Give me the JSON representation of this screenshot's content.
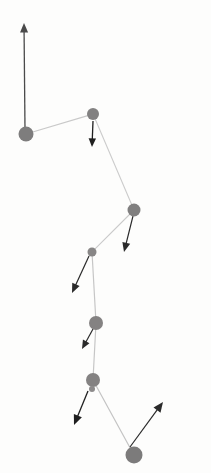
{
  "figure": {
    "title": "",
    "width": 211,
    "height": 473,
    "background_color": "#fdfdfc",
    "node_color": "#807f7f",
    "edge_color": "#c9c9c9",
    "arrow_color": "#1a1a1a"
  },
  "chart_data": {
    "type": "scatter",
    "title": "",
    "xlabel": "",
    "ylabel": "",
    "xlim": [
      0,
      211
    ],
    "ylim": [
      0,
      473
    ],
    "grid": false,
    "legend": null,
    "nodes": [
      {
        "id": "n1",
        "x": 26,
        "y": 134,
        "r": 7.5,
        "color": "#7e7d7d"
      },
      {
        "id": "n2",
        "x": 93,
        "y": 114,
        "r": 6.0,
        "color": "#828181"
      },
      {
        "id": "n3",
        "x": 134,
        "y": 210,
        "r": 6.5,
        "color": "#807f7f"
      },
      {
        "id": "n4",
        "x": 92,
        "y": 252,
        "r": 4.5,
        "color": "#888686"
      },
      {
        "id": "n5",
        "x": 96,
        "y": 323,
        "r": 7.0,
        "color": "#848282"
      },
      {
        "id": "n6",
        "x": 93,
        "y": 380,
        "r": 7.0,
        "color": "#848282"
      },
      {
        "id": "n7",
        "x": 92,
        "y": 389,
        "r": 3.0,
        "color": "#8d8b8b"
      },
      {
        "id": "n8",
        "x": 134,
        "y": 455,
        "r": 8.5,
        "color": "#7c7b7b"
      }
    ],
    "edges": [
      {
        "from": "n1",
        "to": "n2",
        "color": "#c9c9c9",
        "width": 1.2
      },
      {
        "from": "n2",
        "to": "n3",
        "color": "#cccccc",
        "width": 1.1
      },
      {
        "from": "n3",
        "to": "n4",
        "color": "#cacaca",
        "width": 1.1
      },
      {
        "from": "n4",
        "to": "n5",
        "color": "#c6c6c6",
        "width": 1.2
      },
      {
        "from": "n5",
        "to": "n6",
        "color": "#c6c6c6",
        "width": 1.2
      },
      {
        "from": "n6",
        "to": "n8",
        "color": "#c4c4c4",
        "width": 1.2
      }
    ],
    "arrows": [
      {
        "id": "a1",
        "from": "n1",
        "x1": 25,
        "y1": 130,
        "x2": 24,
        "y2": 23,
        "color": "#4a4a4a",
        "width": 1.3,
        "head": 6.5,
        "label": "up"
      },
      {
        "id": "a2",
        "from": "n2",
        "x1": 93,
        "y1": 121,
        "x2": 92,
        "y2": 147,
        "color": "#1f1f1f",
        "width": 1.3,
        "head": 6.0,
        "label": "down"
      },
      {
        "id": "a3",
        "from": "n3",
        "x1": 133,
        "y1": 216,
        "x2": 124,
        "y2": 252,
        "color": "#2a2a2a",
        "width": 1.2,
        "head": 6.5,
        "label": "down-left"
      },
      {
        "id": "a4",
        "from": "n4",
        "x1": 89,
        "y1": 256,
        "x2": 72,
        "y2": 293,
        "color": "#2a2a2a",
        "width": 1.2,
        "head": 6.5,
        "label": "down-left"
      },
      {
        "id": "a5",
        "from": "n5",
        "x1": 93,
        "y1": 329,
        "x2": 82,
        "y2": 349,
        "color": "#2a2a2a",
        "width": 1.2,
        "head": 6.0,
        "label": "down-left"
      },
      {
        "id": "a6",
        "from": "n6",
        "x1": 88,
        "y1": 391,
        "x2": 74,
        "y2": 425,
        "color": "#1f1f1f",
        "width": 1.3,
        "head": 7.0,
        "label": "down-left"
      },
      {
        "id": "a7",
        "from": "n8",
        "x1": 130,
        "y1": 447,
        "x2": 163,
        "y2": 402,
        "color": "#2a2a2a",
        "width": 1.2,
        "head": 7.0,
        "label": "up-right"
      }
    ]
  }
}
